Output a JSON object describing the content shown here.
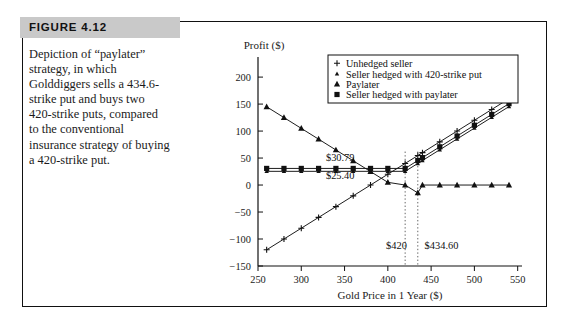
{
  "figure": {
    "label": "FIGURE 4.12",
    "caption": "Depiction of “paylater” strategy, in which Golddiggers sells a 434.6-strike put and buys two 420-strike puts, compared to the conventional insurance strategy of buying a 420-strike put."
  },
  "chart_data": {
    "type": "line",
    "title": "",
    "xlabel": "Gold Price in 1 Year ($)",
    "ylabel": "Profit ($)",
    "xlim": [
      250,
      555
    ],
    "ylim": [
      -150,
      215
    ],
    "xticks": [
      250,
      300,
      350,
      400,
      450,
      500,
      550
    ],
    "yticks": [
      -150,
      -100,
      -50,
      0,
      50,
      100,
      150,
      200
    ],
    "grid": false,
    "legend_position": "top-right",
    "series": [
      {
        "name": "Unhedged seller",
        "marker": "plus",
        "x": [
          260,
          280,
          300,
          320,
          340,
          360,
          380,
          400,
          420,
          434.6,
          440,
          460,
          480,
          500,
          520,
          540
        ],
        "values": [
          -120,
          -100,
          -80,
          -60,
          -40,
          -20,
          0,
          20,
          40,
          54.6,
          60,
          80,
          100,
          120,
          140,
          160
        ]
      },
      {
        "name": "Seller hedged with 420-strike put",
        "marker": "triangle-small",
        "x": [
          260,
          280,
          300,
          320,
          340,
          360,
          380,
          400,
          420,
          434.6,
          440,
          460,
          480,
          500,
          520,
          540
        ],
        "values": [
          25.4,
          25.4,
          25.4,
          25.4,
          25.4,
          25.4,
          25.4,
          25.4,
          25.4,
          40,
          45.4,
          65.4,
          85.4,
          105.4,
          125.4,
          145.4
        ]
      },
      {
        "name": "Paylater",
        "marker": "triangle",
        "x": [
          260,
          280,
          300,
          320,
          340,
          360,
          380,
          400,
          420,
          434.6,
          440,
          460,
          480,
          500,
          520,
          540
        ],
        "values": [
          145,
          125,
          105,
          85,
          65,
          45,
          25,
          5,
          0,
          -14.6,
          0,
          0,
          0,
          0,
          0,
          0
        ]
      },
      {
        "name": "Seller hedged with paylater",
        "marker": "square",
        "x": [
          260,
          280,
          300,
          320,
          340,
          360,
          380,
          400,
          420,
          434.6,
          440,
          460,
          480,
          500,
          520,
          540
        ],
        "values": [
          30.79,
          30.79,
          30.79,
          30.79,
          30.79,
          30.79,
          30.79,
          30.79,
          30.79,
          45.4,
          50.79,
          70.79,
          90.79,
          110.79,
          130.79,
          150.79
        ]
      }
    ],
    "annotations": [
      {
        "text": "$30.79",
        "x": 345,
        "y": 45
      },
      {
        "text": "$25.40",
        "x": 345,
        "y": 12
      },
      {
        "text": "$420",
        "x": 410,
        "y": -118
      },
      {
        "text": "$434.60",
        "x": 462,
        "y": -118
      }
    ],
    "vlines": [
      420,
      434.6
    ]
  }
}
